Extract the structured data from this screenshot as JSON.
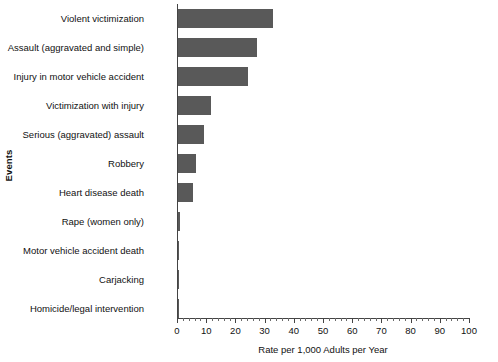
{
  "chart_data": {
    "type": "bar",
    "orientation": "horizontal",
    "title": "",
    "xlabel": "Rate per 1,000 Adults per Year",
    "ylabel": "Events",
    "xlim": [
      0,
      100
    ],
    "xticks": [
      0,
      10,
      20,
      30,
      40,
      50,
      60,
      70,
      80,
      90,
      100
    ],
    "minor_tick_step": 2,
    "grid": false,
    "legend": null,
    "bar_color": "#595959",
    "axis_color": "#444444",
    "categories": [
      "Violent victimization",
      "Assault (aggravated and simple)",
      "Injury in motor vehicle accident",
      "Victimization with injury",
      "Serious (aggravated) assault",
      "Robbery",
      "Heart disease death",
      "Rape (women only)",
      "Motor vehicle accident death",
      "Carjacking",
      "Homicide/legal intervention"
    ],
    "values": [
      32.6,
      27.1,
      24.0,
      11.4,
      9.0,
      6.0,
      5.0,
      0.7,
      0.2,
      0.1,
      0.1
    ]
  }
}
